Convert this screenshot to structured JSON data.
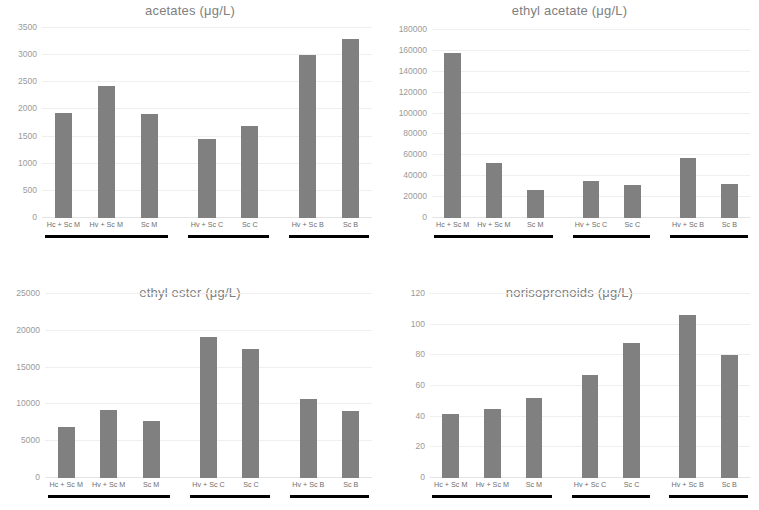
{
  "figure": {
    "bar_color": "#808080",
    "grid_color": "#efefef",
    "group_bar_color": "#000000",
    "background": "#ffffff",
    "categories": [
      "Hc + Sc M",
      "Hv + Sc M",
      "Sc M",
      "Hv + Sc C",
      "Sc C",
      "Hv + Sc B",
      "Sc B"
    ],
    "groups": [
      {
        "label": "M",
        "members": [
          "Hc + Sc M",
          "Hv + Sc M",
          "Sc M"
        ]
      },
      {
        "label": "C",
        "members": [
          "Hv + Sc C",
          "Sc C"
        ]
      },
      {
        "label": "B",
        "members": [
          "Hv + Sc B",
          "Sc B"
        ]
      }
    ]
  },
  "chart_data": [
    {
      "type": "bar",
      "panel": "top-left",
      "title": "acetates (μg/L)",
      "xlabel": "",
      "ylabel": "",
      "categories": [
        "Hc + Sc M",
        "Hv + Sc M",
        "Sc M",
        "Hv + Sc C",
        "Sc C",
        "Hv + Sc B",
        "Sc B"
      ],
      "values": [
        1940,
        2430,
        1910,
        1450,
        1700,
        3000,
        3290
      ],
      "ylim": [
        0,
        3500
      ],
      "yticks": [
        0,
        500,
        1000,
        1500,
        2000,
        2500,
        3000,
        3500
      ],
      "ytick_labels": [
        "0",
        "500",
        "1000",
        "1500",
        "2000",
        "2500",
        "3000",
        "3500"
      ],
      "grid": true,
      "legend": "none"
    },
    {
      "type": "bar",
      "panel": "top-right",
      "title": "ethyl acetate (μg/L)",
      "xlabel": "",
      "ylabel": "",
      "categories": [
        "Hc + Sc M",
        "Hv + Sc M",
        "Sc M",
        "Hv + Sc C",
        "Sc C",
        "Hv + Sc B",
        "Sc B"
      ],
      "values": [
        158000,
        52500,
        26500,
        35500,
        32000,
        57000,
        32500
      ],
      "ylim": [
        0,
        180000
      ],
      "yticks": [
        0,
        20000,
        40000,
        60000,
        80000,
        100000,
        120000,
        140000,
        160000,
        180000
      ],
      "ytick_labels": [
        "0",
        "20000",
        "40000",
        "60000",
        "80000",
        "100000",
        "120000",
        "140000",
        "160000",
        "180000"
      ],
      "grid": true,
      "legend": "none"
    },
    {
      "type": "bar",
      "panel": "bottom-left",
      "title": "ethyl ester (μg/L)",
      "xlabel": "",
      "ylabel": "",
      "categories": [
        "Hc + Sc M",
        "Hv + Sc M",
        "Sc M",
        "Hv + Sc C",
        "Sc C",
        "Hv + Sc B",
        "Sc B"
      ],
      "values": [
        6900,
        9200,
        7800,
        19200,
        17500,
        10800,
        9100
      ],
      "ylim": [
        0,
        25000
      ],
      "yticks": [
        0,
        5000,
        10000,
        15000,
        20000,
        25000
      ],
      "ytick_labels": [
        "0",
        "5000",
        "10000",
        "15000",
        "20000",
        "25000"
      ],
      "grid": true,
      "legend": "none"
    },
    {
      "type": "bar",
      "panel": "bottom-right",
      "title": "norisoprenoids (μg/L)",
      "xlabel": "",
      "ylabel": "",
      "categories": [
        "Hc + Sc M",
        "Hv + Sc M",
        "Sc M",
        "Hv + Sc C",
        "Sc C",
        "Hv + Sc B",
        "Sc B"
      ],
      "values": [
        42,
        45,
        52,
        67,
        88,
        106,
        80
      ],
      "ylim": [
        0,
        120
      ],
      "yticks": [
        0,
        20,
        40,
        60,
        80,
        100,
        120
      ],
      "ytick_labels": [
        "0",
        "20",
        "40",
        "60",
        "80",
        "100",
        "120"
      ],
      "grid": true,
      "legend": "none"
    }
  ]
}
